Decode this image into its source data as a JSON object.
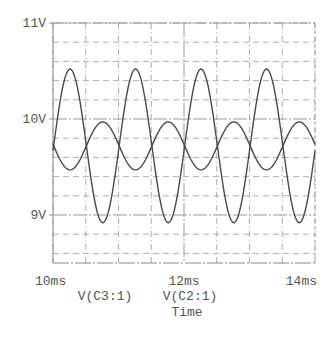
{
  "chart_data": {
    "type": "line",
    "title": "",
    "xlabel": "Time",
    "ylabel": "",
    "xlim": [
      10,
      14
    ],
    "ylim": [
      8.5,
      11
    ],
    "x_unit": "ms",
    "y_unit": "V",
    "grid": true,
    "x_ticks": [
      {
        "value": 10,
        "label": "10ms"
      },
      {
        "value": 12,
        "label": "12ms"
      },
      {
        "value": 14,
        "label": "14ms"
      }
    ],
    "y_ticks": [
      {
        "value": 11,
        "label": "11V"
      },
      {
        "value": 10,
        "label": "10V"
      },
      {
        "value": 9,
        "label": "9V"
      }
    ],
    "x_grid_step": 0.5,
    "y_grid_step": 0.2,
    "legend": [
      "V(C3:1)",
      "V(C2:1)"
    ],
    "legend_position": "below x-axis",
    "series": [
      {
        "name": "V(C3:1)",
        "waveform": "sine",
        "frequency_khz": 1.0,
        "offset_v": 9.72,
        "amplitude_v": 0.8,
        "peak_v": 10.52,
        "trough_v": 8.92,
        "first_peak_ms": 10.26,
        "x": [
          10.0,
          10.25,
          10.5,
          10.75,
          11.0,
          11.25,
          11.5,
          11.75,
          12.0,
          12.25,
          12.5,
          12.75,
          13.0,
          13.25,
          13.5,
          13.75,
          14.0
        ],
        "values": [
          9.72,
          10.52,
          9.72,
          8.92,
          9.72,
          10.52,
          9.72,
          8.92,
          9.72,
          10.52,
          9.72,
          8.92,
          9.72,
          10.52,
          9.72,
          8.92,
          9.72
        ]
      },
      {
        "name": "V(C2:1)",
        "waveform": "sine",
        "frequency_khz": 1.0,
        "offset_v": 9.72,
        "amplitude_v": 0.25,
        "peak_v": 9.97,
        "trough_v": 9.47,
        "first_peak_ms": 10.76,
        "x": [
          10.0,
          10.25,
          10.5,
          10.75,
          11.0,
          11.25,
          11.5,
          11.75,
          12.0,
          12.25,
          12.5,
          12.75,
          13.0,
          13.25,
          13.5,
          13.75,
          14.0
        ],
        "values": [
          9.72,
          9.47,
          9.72,
          9.97,
          9.72,
          9.47,
          9.72,
          9.97,
          9.72,
          9.47,
          9.72,
          9.97,
          9.72,
          9.47,
          9.72,
          9.97,
          9.72
        ]
      }
    ]
  },
  "plot_area": {
    "left_px": 53,
    "right_px": 315,
    "top_px": 23,
    "bottom_px": 263
  },
  "colors": {
    "trace": "#4a4a4a",
    "grid": "#9a9a9a",
    "axis": "#8a8a8a",
    "text": "#555555",
    "background": "#ffffff"
  }
}
